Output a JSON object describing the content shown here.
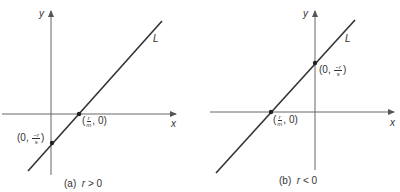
{
  "figure": {
    "line_color": "#333333",
    "axis_color": "#555555",
    "panels": [
      {
        "id": "a",
        "caption_tag": "(a)",
        "caption_cond_var": "r",
        "caption_cond_op": ">",
        "caption_cond_val": "0",
        "axis_x_label": "x",
        "axis_y_label": "y",
        "line_label": "L",
        "x_intercept": {
          "open": "(",
          "num": "r",
          "den": "m",
          "rest": ", 0)"
        },
        "y_intercept": {
          "open": "(0, ",
          "num": "−r",
          "den": "s",
          "rest": ")"
        }
      },
      {
        "id": "b",
        "caption_tag": "(b)",
        "caption_cond_var": "r",
        "caption_cond_op": "<",
        "caption_cond_val": "0",
        "axis_x_label": "x",
        "axis_y_label": "y",
        "line_label": "L",
        "x_intercept": {
          "open": "(",
          "num": "r",
          "den": "m",
          "rest": ", 0)"
        },
        "y_intercept": {
          "open": "(0, ",
          "num": "−r",
          "den": "s",
          "rest": ")"
        }
      }
    ]
  }
}
